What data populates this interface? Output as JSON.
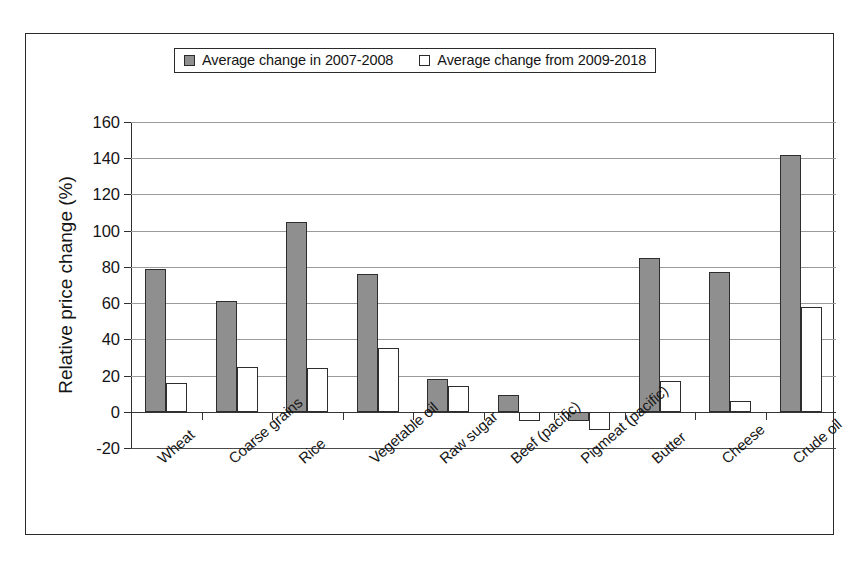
{
  "chart_data": {
    "type": "bar",
    "title": "",
    "xlabel": "",
    "ylabel": "Relative price change (%)",
    "ylim": [
      -20,
      160
    ],
    "ytick_step": 20,
    "yticks": [
      160,
      140,
      120,
      100,
      80,
      60,
      40,
      20,
      0,
      -20
    ],
    "ytick_labels": [
      "160",
      "140",
      "120",
      "100",
      "80",
      "60",
      "40",
      "20",
      "0",
      "-20"
    ],
    "grid": true,
    "legend_position": "top-center",
    "categories": [
      "Wheat",
      "Coarse grains",
      "Rice",
      "Vegetable oil",
      "Raw sugar",
      "Beef (pacific)",
      "Pigmeat (pacific)",
      "Butter",
      "Cheese",
      "Crude oil"
    ],
    "series": [
      {
        "name": "Average change in 2007-2008",
        "color": "#8f8f8f",
        "values": [
          79,
          61,
          105,
          76,
          18,
          9,
          -5,
          85,
          77,
          142
        ]
      },
      {
        "name": "Average change from 2009-2018",
        "color": "#ffffff",
        "values": [
          16,
          25,
          24,
          35,
          14,
          -5,
          -10,
          17,
          6,
          58
        ]
      }
    ]
  },
  "legend": {
    "entries": [
      {
        "label": "Average change in 2007-2008",
        "swatch": "grey",
        "icon": "legend-swatch-icon"
      },
      {
        "label": "Average change from 2009-2018",
        "swatch": "white",
        "icon": "legend-swatch-icon"
      }
    ]
  },
  "axes": {
    "y_title": "Relative price change (%)"
  }
}
